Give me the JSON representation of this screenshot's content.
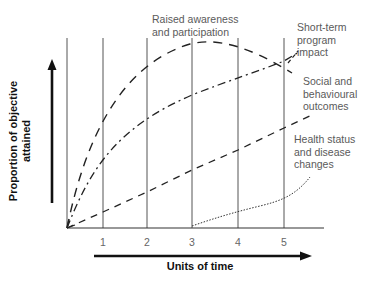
{
  "diagram": {
    "y_axis_title_line1": "Proportion of objective",
    "y_axis_title_line2": "attained",
    "x_axis_title": "Units of time",
    "ticks": [
      "1",
      "2",
      "3",
      "4",
      "5"
    ],
    "labels": {
      "awareness_line1": "Raised awareness",
      "awareness_line2": "and participation",
      "shortterm_line1": "Short-term",
      "shortterm_line2": "program",
      "shortterm_line3": "impact",
      "social_line1": "Social and",
      "social_line2": "behavioural",
      "social_line3": "outcomes",
      "health_line1": "Health status",
      "health_line2": "and disease",
      "health_line3": "changes"
    },
    "curves": [
      {
        "name": "Raised awareness and participation",
        "style": "long-dash",
        "shape": "rises steeply from origin, peaks around t=3-4, declines toward t=5"
      },
      {
        "name": "Social and behavioural outcomes",
        "style": "dash-dot",
        "shape": "rises from origin, reaches ~peak near t=5"
      },
      {
        "name": "Health status and disease changes",
        "style": "short-dash",
        "shape": "linear rise from origin to beyond t=5"
      },
      {
        "name": "Short-term program impact",
        "style": "dotted",
        "shape": "starts at t=3, gradually rises, curving upward after t=5"
      }
    ],
    "colors": {
      "line": "#222222",
      "grid": "#555555",
      "text": "#5a5a5a",
      "axis_title": "#111111"
    }
  }
}
